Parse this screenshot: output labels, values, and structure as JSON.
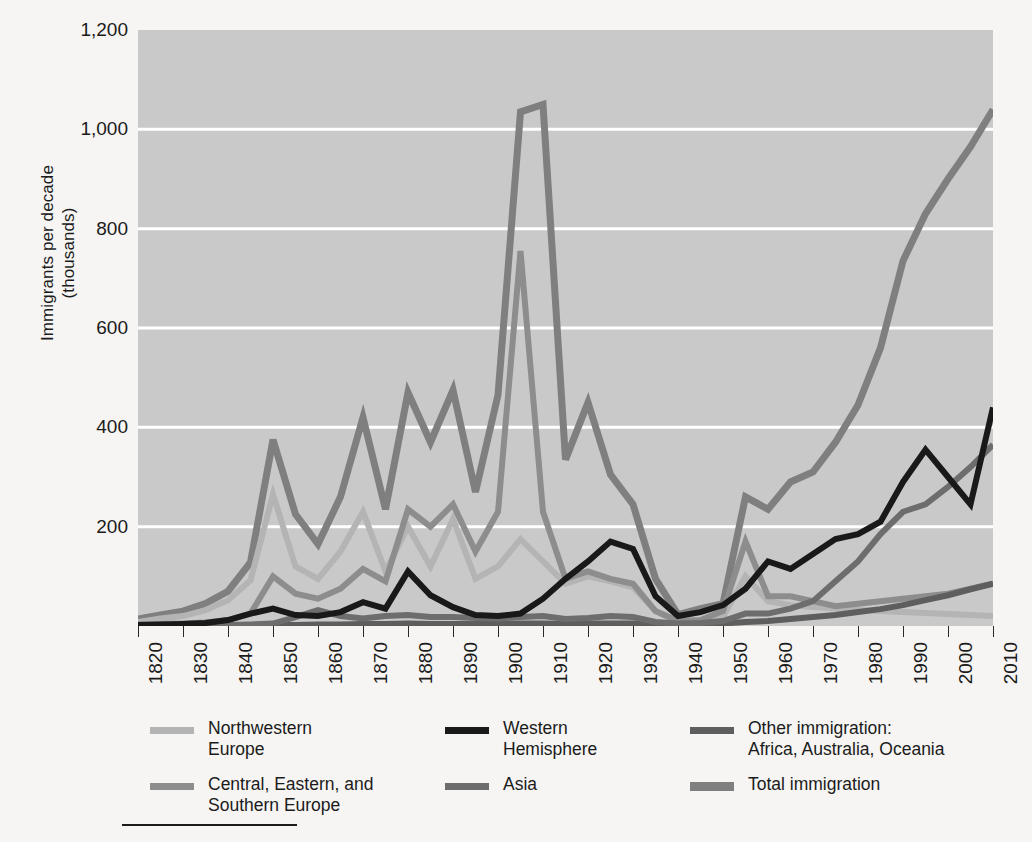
{
  "axes": {
    "y_label": "Immigrants per decade\n(thousands)",
    "y_ticks": [
      "1,200",
      "1,000",
      "800",
      "600",
      "400",
      "200"
    ],
    "y_tick_values": [
      1200,
      1000,
      800,
      600,
      400,
      200
    ],
    "x_ticks": [
      "1820",
      "1830",
      "1840",
      "1850",
      "1860",
      "1870",
      "1880",
      "1890",
      "1900",
      "1910",
      "1920",
      "1930",
      "1940",
      "1950",
      "1960",
      "1970",
      "1980",
      "1990",
      "2000",
      "2010"
    ]
  },
  "legend": {
    "columns": [
      {
        "items": [
          {
            "label": "Northwestern\nEurope",
            "color": "#b4b4b4",
            "thick": false,
            "key": "northwestern_europe"
          },
          {
            "label": "Central, Eastern, and\nSouthern Europe",
            "color": "#8d8d8d",
            "thick": false,
            "key": "central_eastern_southern_europe"
          }
        ]
      },
      {
        "items": [
          {
            "label": "Western\nHemisphere",
            "color": "#191919",
            "thick": false,
            "key": "western_hemisphere"
          },
          {
            "label": "Asia",
            "color": "#6d6d6d",
            "thick": false,
            "key": "asia"
          }
        ]
      },
      {
        "items": [
          {
            "label": "Other immigration:\nAfrica, Australia, Oceania",
            "color": "#5e5e5e",
            "thick": false,
            "key": "other_immigration"
          },
          {
            "label": "Total immigration",
            "color": "#7f7f7f",
            "thick": true,
            "key": "total_immigration"
          }
        ]
      }
    ]
  },
  "colors": {
    "page_background": "#f6f5f3",
    "plot_background": "#c9c9c9",
    "gridline": "#ffffff",
    "text": "#1b1b1b"
  },
  "chart_data": {
    "type": "line",
    "title": "",
    "xlabel": "",
    "ylabel": "Immigrants per decade (thousands)",
    "xlim": [
      1820,
      2010
    ],
    "ylim": [
      0,
      1200
    ],
    "grid": true,
    "legend_position": "bottom",
    "x": [
      1820,
      1825,
      1830,
      1835,
      1840,
      1845,
      1850,
      1855,
      1860,
      1865,
      1870,
      1875,
      1880,
      1885,
      1890,
      1895,
      1900,
      1905,
      1910,
      1915,
      1920,
      1925,
      1930,
      1935,
      1940,
      1945,
      1950,
      1955,
      1960,
      1965,
      1970,
      1975,
      1980,
      1985,
      1990,
      1995,
      2000,
      2005,
      2010
    ],
    "series": [
      {
        "name": "Total immigration",
        "color": "#7f7f7f",
        "width": 7,
        "values": [
          14,
          22,
          30,
          45,
          70,
          128,
          375,
          225,
          165,
          260,
          420,
          235,
          470,
          370,
          475,
          270,
          465,
          1035,
          1050,
          335,
          450,
          305,
          245,
          95,
          23,
          35,
          45,
          260,
          235,
          290,
          310,
          370,
          445,
          560,
          735,
          830,
          900,
          965,
          1040
        ]
      },
      {
        "name": "Central, Eastern, and Southern Europe",
        "color": "#8d8d8d",
        "width": 6,
        "values": [
          3,
          4,
          5,
          7,
          12,
          25,
          100,
          65,
          55,
          75,
          115,
          90,
          235,
          200,
          245,
          150,
          230,
          755,
          230,
          95,
          110,
          95,
          85,
          30,
          10,
          12,
          30,
          170,
          60,
          60,
          50,
          40,
          45,
          50,
          55,
          60,
          65,
          75,
          85
        ]
      },
      {
        "name": "Northwestern Europe",
        "color": "#b4b4b4",
        "width": 6,
        "values": [
          8,
          15,
          20,
          32,
          52,
          92,
          265,
          120,
          95,
          150,
          230,
          110,
          200,
          120,
          215,
          95,
          120,
          175,
          130,
          85,
          100,
          90,
          78,
          30,
          8,
          10,
          18,
          100,
          50,
          42,
          38,
          35,
          32,
          30,
          28,
          26,
          24,
          22,
          20
        ]
      },
      {
        "name": "Western Hemisphere",
        "color": "#191919",
        "width": 6,
        "values": [
          2,
          3,
          4,
          6,
          12,
          25,
          35,
          22,
          20,
          28,
          48,
          35,
          110,
          62,
          38,
          22,
          20,
          25,
          55,
          95,
          130,
          170,
          155,
          60,
          20,
          28,
          42,
          75,
          130,
          115,
          145,
          175,
          185,
          210,
          290,
          355,
          300,
          245,
          440
        ]
      },
      {
        "name": "Asia",
        "color": "#6d6d6d",
        "width": 6,
        "values": [
          1,
          1,
          1,
          1,
          2,
          3,
          5,
          18,
          32,
          20,
          15,
          20,
          22,
          18,
          18,
          16,
          15,
          18,
          20,
          14,
          16,
          20,
          18,
          8,
          5,
          6,
          10,
          25,
          25,
          35,
          50,
          90,
          130,
          185,
          230,
          245,
          280,
          320,
          365
        ]
      },
      {
        "name": "Other immigration: Africa, Australia, Oceania",
        "color": "#5e5e5e",
        "width": 6,
        "values": [
          1,
          1,
          1,
          1,
          1,
          1,
          2,
          2,
          3,
          3,
          4,
          4,
          5,
          4,
          4,
          4,
          4,
          5,
          5,
          4,
          5,
          5,
          5,
          4,
          3,
          3,
          5,
          8,
          10,
          14,
          18,
          22,
          28,
          34,
          42,
          52,
          62,
          74,
          85
        ]
      }
    ]
  }
}
